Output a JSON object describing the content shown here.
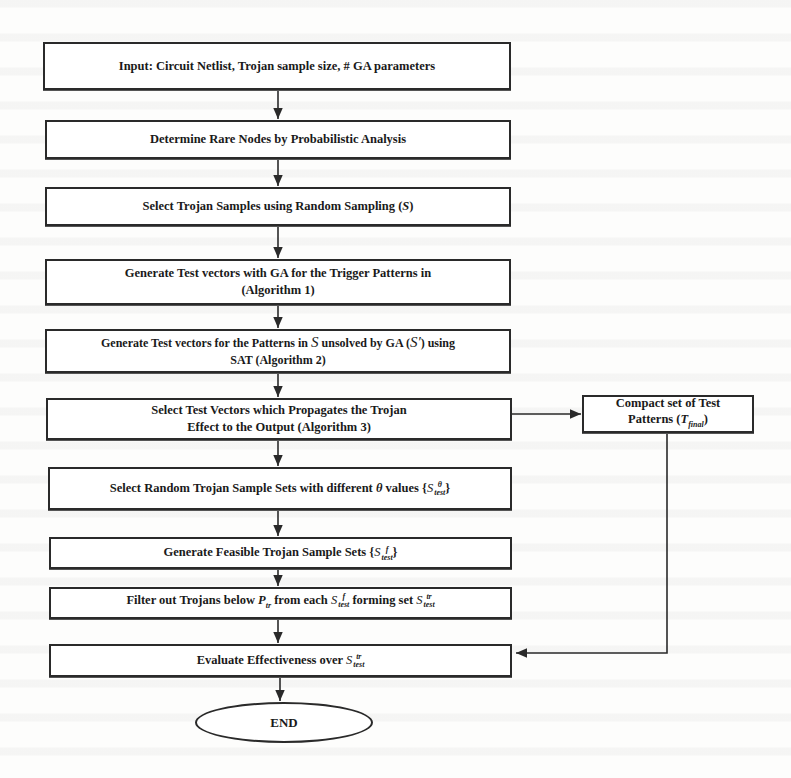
{
  "flowchart": {
    "steps": [
      {
        "id": "input",
        "text": "Input: Circuit Netlist, Trojan sample size, # GA parameters"
      },
      {
        "id": "rare-nodes",
        "text": "Determine Rare Nodes by Probabilistic Analysis"
      },
      {
        "id": "select-samples",
        "text": "Select Trojan Samples using Random Sampling (",
        "math": "S",
        "suffix": ")"
      },
      {
        "id": "ga-vectors",
        "line1": "Generate Test vectors with GA for the Trigger Patterns in",
        "line2": "(Algorithm 1)"
      },
      {
        "id": "sat-vectors",
        "line1_a": "Generate Test vectors  for the Patterns in ",
        "line1_math": "S",
        "line1_b": " unsolved by GA (",
        "line1_math2": "S′",
        "line1_c": ") using",
        "line2": "SAT (Algorithm 2)"
      },
      {
        "id": "propagate",
        "line1": "Select Test Vectors which Propagates the Trojan",
        "line2": "Effect to the Output (Algorithm 3)"
      },
      {
        "id": "random-sets",
        "text_a": "Select Random Trojan Sample Sets with different ",
        "theta": "θ",
        "text_b": " values {",
        "S": "S",
        "sup": "θ",
        "sub": "test",
        "close": "}"
      },
      {
        "id": "feasible-sets",
        "text_a": "Generate Feasible Trojan Sample Sets {",
        "S": "S",
        "sup": "f",
        "sub": "test",
        "close": "}"
      },
      {
        "id": "filter",
        "text_a": "Filter out Trojans below ",
        "P": "P",
        "P_sub": "tr",
        "text_b": " from each ",
        "S1": "S",
        "S1_sup": "f",
        "S1_sub": "test",
        "text_c": " forming set ",
        "S2": "S",
        "S2_sup": "tr",
        "S2_sub": "test"
      },
      {
        "id": "evaluate",
        "text_a": "Evaluate Effectiveness over ",
        "S": "S",
        "sup": "tr",
        "sub": "test"
      }
    ],
    "side_box": {
      "line1": "Compact set of Test",
      "line2_a": "Patterns (",
      "T": "T",
      "T_sub": "final",
      "line2_b": ")"
    },
    "end": {
      "text": "END"
    }
  },
  "colors": {
    "stroke": "#2a2a2a",
    "background": "#fdfdfc"
  }
}
